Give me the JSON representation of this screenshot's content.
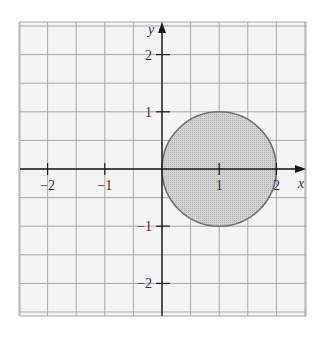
{
  "chart_data": {
    "type": "region",
    "title": "",
    "xlabel": "x",
    "ylabel": "y",
    "xlim": [
      -2.5,
      2.5
    ],
    "ylim": [
      -2.5,
      2.5
    ],
    "grid": true,
    "grid_step": 0.5,
    "x_ticks": [
      -2,
      -1,
      1,
      2
    ],
    "y_ticks": [
      2,
      1,
      -1,
      -2
    ],
    "x_tick_labels": [
      "−2",
      "−1",
      "1",
      "2"
    ],
    "y_tick_labels": [
      "2",
      "1",
      "−1",
      "−2"
    ],
    "shapes": [
      {
        "kind": "circle",
        "center": [
          1,
          0
        ],
        "radius": 1,
        "filled": true,
        "description": "disk (x−1)² + y² ≤ 1"
      }
    ]
  },
  "colors": {
    "grid": "#a8a8a8",
    "axis": "#1a1a1a",
    "circle_stroke": "#6e6e6e",
    "circle_fill": "#c8c8c8",
    "background": "#f4f4f4"
  }
}
